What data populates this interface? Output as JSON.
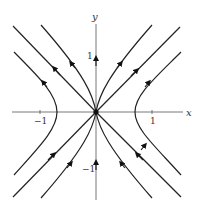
{
  "diagram": {
    "type": "phase-portrait",
    "axes": {
      "x_label": "x",
      "y_label": "y",
      "x_ticks": [
        {
          "value": -1,
          "label": "−1"
        },
        {
          "value": 1,
          "label": "1"
        }
      ],
      "y_ticks": [
        {
          "value": 1,
          "label": "1"
        },
        {
          "value": -1,
          "label": "−1"
        }
      ],
      "range": [
        -1.5,
        1.5
      ]
    },
    "equilibrium": {
      "x": 0,
      "y": 0,
      "label": "origin"
    },
    "trajectories": [
      {
        "name": "diagonal-up-left",
        "description": "line y = -x, upper-left branch, flow away from origin"
      },
      {
        "name": "diagonal-up-right",
        "description": "line y = x, upper-right branch, flow away from origin"
      },
      {
        "name": "diagonal-down-left",
        "description": "line y = x, lower-left branch, flow toward origin"
      },
      {
        "name": "diagonal-down-right",
        "description": "line y = -x, lower-right branch, flow toward origin"
      },
      {
        "name": "y-axis-upper",
        "description": "positive y-axis, flow upward"
      },
      {
        "name": "y-axis-lower",
        "description": "negative y-axis, flow upward toward origin"
      },
      {
        "name": "hyperbola-left",
        "description": "left hyperbola branch opening left, flow upward"
      },
      {
        "name": "hyperbola-right",
        "description": "right hyperbola branch opening right, flow upward"
      },
      {
        "name": "curve-through-origin",
        "description": "curves entering from below and leaving above through origin"
      }
    ]
  }
}
